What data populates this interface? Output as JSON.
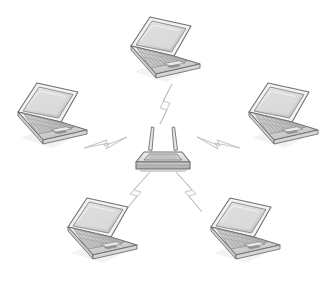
{
  "diagram": {
    "title": "Wireless Network Topology",
    "subtitle": "Five laptop clients connected wirelessly to a central wireless router",
    "style": "grayscale pencil sketch line art",
    "background_color": "#ffffff",
    "canvas": {
      "width": 325,
      "height": 282
    }
  },
  "palette": {
    "outline": "#6b6b6b",
    "outline_dark": "#4a4a4a",
    "screen_fill": "#d9d9d9",
    "screen_fill_light": "#e6e6e6",
    "bezel_fill": "#f0f0f0",
    "base_fill": "#e2e2e2",
    "base_fill_light": "#efefef",
    "keyboard_fill": "#c9c9c9",
    "shadow_fill": "#b0b0b0",
    "router_top": "#e8e8e8",
    "router_side": "#bdbdbd",
    "router_panel": "#cfcfcf",
    "bolt_fill": "#fbfbfb",
    "bolt_stroke": "#b9b9b9",
    "rule_color": "#b5b5b5"
  },
  "router": {
    "label": "Wireless Router",
    "icon": "wireless-router-icon",
    "antenna_count": 2,
    "position": {
      "x": 162,
      "y": 150
    }
  },
  "laptops": [
    {
      "id": "laptop-top",
      "label": "Laptop",
      "icon": "laptop-icon",
      "position_label": "top",
      "position": {
        "x": 160,
        "y": 48
      }
    },
    {
      "id": "laptop-left",
      "label": "Laptop",
      "icon": "laptop-icon",
      "position_label": "upper-left",
      "position": {
        "x": 47,
        "y": 113
      }
    },
    {
      "id": "laptop-right",
      "label": "Laptop",
      "icon": "laptop-icon",
      "position_label": "upper-right",
      "position": {
        "x": 277,
        "y": 113
      }
    },
    {
      "id": "laptop-bottom-left",
      "label": "Laptop",
      "icon": "laptop-icon",
      "position_label": "lower-left",
      "position": {
        "x": 97,
        "y": 228
      }
    },
    {
      "id": "laptop-bottom-right",
      "label": "Laptop",
      "icon": "laptop-icon",
      "position_label": "lower-right",
      "position": {
        "x": 240,
        "y": 228
      }
    }
  ],
  "links": [
    {
      "id": "link-top",
      "icon": "wireless-signal-bolt-icon",
      "label": "Wireless link",
      "from": "router",
      "to": "laptop-top"
    },
    {
      "id": "link-left",
      "icon": "wireless-signal-bolt-icon",
      "label": "Wireless link",
      "from": "router",
      "to": "laptop-left"
    },
    {
      "id": "link-right",
      "icon": "wireless-signal-bolt-icon",
      "label": "Wireless link",
      "from": "router",
      "to": "laptop-right"
    },
    {
      "id": "link-bottom-left",
      "icon": "wireless-signal-bolt-icon",
      "label": "Wireless link",
      "from": "router",
      "to": "laptop-bottom-left"
    },
    {
      "id": "link-bottom-right",
      "icon": "wireless-signal-bolt-icon",
      "label": "Wireless link",
      "from": "router",
      "to": "laptop-bottom-right"
    }
  ],
  "footer_rule": {
    "label": "horizontal divider rule",
    "x1": 8,
    "x2": 317,
    "y": 267,
    "thickness": 1.6
  }
}
